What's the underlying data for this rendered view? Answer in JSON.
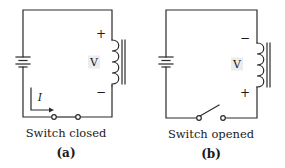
{
  "figure": {
    "panel_a": {
      "id_label": "(a)",
      "caption": "Switch closed",
      "switch_state": "closed",
      "inductor_label": "V",
      "top_polarity": "+",
      "bottom_polarity": "−",
      "current_label": "I"
    },
    "panel_b": {
      "id_label": "(b)",
      "caption": "Switch opened",
      "switch_state": "open",
      "inductor_label": "V",
      "top_polarity": "−",
      "bottom_polarity": "+"
    },
    "colors": {
      "wire": "#2a2a2a",
      "label_bg": "#ececec",
      "background": "#ffffff"
    }
  }
}
